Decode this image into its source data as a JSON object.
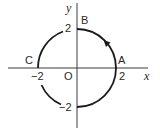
{
  "diagram": {
    "axes": {
      "x_label": "x",
      "y_label": "y",
      "origin_label": "O"
    },
    "ticks": {
      "x_pos": "2",
      "x_neg": "−2",
      "y_pos": "2",
      "y_neg": "−2"
    },
    "points": {
      "A": "A",
      "B": "B",
      "C": "C"
    },
    "circle": {
      "radius": 2,
      "center": [
        0,
        0
      ],
      "direction": "counterclockwise",
      "arrow_location": "between A and B"
    },
    "colors": {
      "stroke": "#1a1a1a",
      "axis": "#3a3a3a",
      "background": "#ffffff"
    }
  }
}
